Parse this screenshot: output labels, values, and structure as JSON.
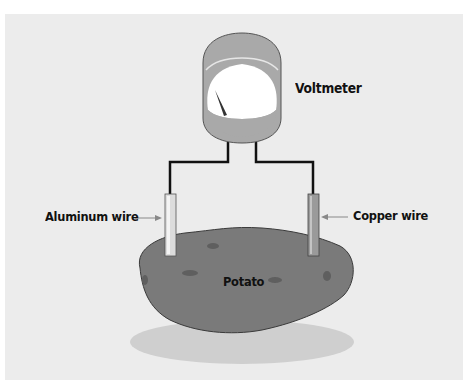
{
  "diagram": {
    "labels": {
      "voltmeter": "Voltmeter",
      "aluminum_wire": "Aluminum wire",
      "copper_wire": "Copper wire",
      "potato": "Potato"
    },
    "colors": {
      "background_panel": "#ececec",
      "meter_body": "#a9a9a9",
      "meter_face": "#ffffff",
      "wire": "#111111",
      "aluminum_probe": "#dcdcdc",
      "copper_probe": "#9a9a9a",
      "potato": "#7a7a7a",
      "shadow": "#cfcfcf"
    }
  }
}
